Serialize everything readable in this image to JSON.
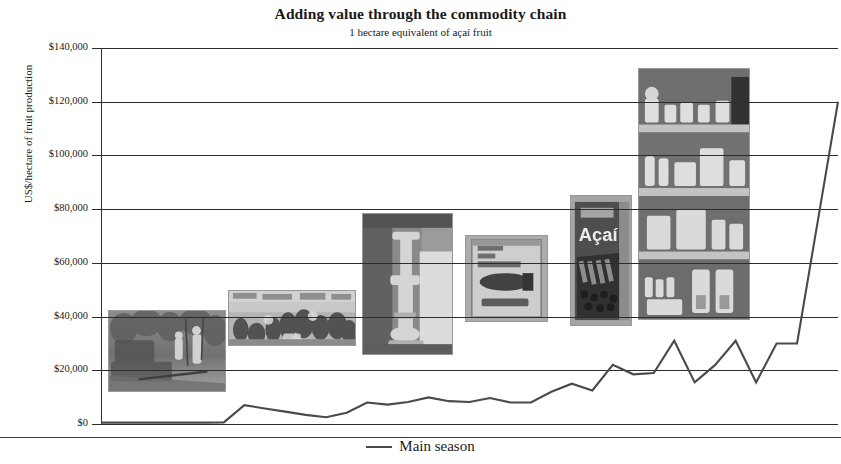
{
  "chart_data": {
    "type": "line",
    "title": "Adding value through the commodity chain",
    "subtitle": "1 hectare equivalent of açaí fruit",
    "xlabel": "",
    "ylabel": "US$/hectare of fruit production",
    "ylim": [
      0,
      140000
    ],
    "ytick_labels": [
      "$140,000",
      "$120,000",
      "$100,000",
      "$80,000",
      "$60,000",
      "$40,000",
      "$20,000",
      "$0"
    ],
    "ytick_values": [
      140000,
      120000,
      100000,
      80000,
      60000,
      40000,
      20000,
      0
    ],
    "grid": true,
    "legend_position": "bottom",
    "line_color": "#4a4a4a",
    "series": [
      {
        "name": "Main season",
        "x": [
          0,
          1,
          2,
          3,
          4,
          5,
          6,
          7,
          8,
          9,
          10,
          11,
          12,
          13,
          14,
          15,
          16,
          17,
          18,
          19,
          20,
          21,
          22,
          23,
          24,
          25,
          26,
          27,
          28,
          29,
          30,
          31,
          32,
          33,
          34,
          35,
          36
        ],
        "values": [
          500,
          500,
          500,
          500,
          500,
          500,
          600,
          7000,
          5800,
          4600,
          3400,
          2500,
          4200,
          8000,
          7200,
          8200,
          9900,
          8500,
          8200,
          9700,
          8000,
          8000,
          12000,
          15000,
          12500,
          22000,
          18500,
          19000,
          31000,
          15500,
          22000,
          31000,
          15500,
          30000,
          30000,
          75000,
          120000
        ]
      }
    ],
    "annotations": [
      {
        "name": "harvest-photo",
        "caption": "açaí fruit harvesting in the forest"
      },
      {
        "name": "market-photo",
        "caption": "riverside açaí fruit market"
      },
      {
        "name": "processing-photo",
        "caption": "pulp processing equipment"
      },
      {
        "name": "pulp-package-photo",
        "caption": "Brasfrut frozen pulp package"
      },
      {
        "name": "acai-product-photo",
        "caption": "Açaí branded retail product"
      },
      {
        "name": "retail-shelf-photo",
        "caption": "supermarket shelves of açaí products"
      }
    ]
  },
  "legend": {
    "items": [
      {
        "label": "Main season",
        "color": "#4a4a4a"
      }
    ]
  }
}
